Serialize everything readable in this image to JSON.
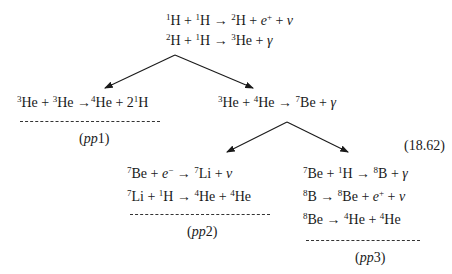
{
  "equation_number": "(18.62)",
  "top": {
    "lines": [
      "¹H + ¹H → ²H + e⁺ + ν",
      "²H + ¹H → ³He + γ"
    ]
  },
  "branches": {
    "pp1": {
      "label": "(pp1)",
      "lines": [
        "³He + ³He → ⁴He + 2¹H"
      ]
    },
    "mid": {
      "lines": [
        "³He + ⁴He → ⁷Be + γ"
      ]
    },
    "pp2": {
      "label": "(pp2)",
      "lines": [
        "⁷Be + e⁻ → ⁷Li + ν",
        "⁷Li + ¹H → ⁴He + ⁴He"
      ]
    },
    "pp3": {
      "label": "(pp3)",
      "lines": [
        "⁷Be + ¹H → ⁸B + γ",
        "⁸B → ⁸Be + e⁺ + ν",
        "⁸Be → ⁴He + ⁴He"
      ]
    }
  },
  "colors": {
    "ink": "#1a1a1a",
    "background": "#ffffff"
  }
}
